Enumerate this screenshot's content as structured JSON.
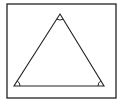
{
  "figure": {
    "stroke_color": "#222222",
    "background_color": "#ffffff",
    "frame": {
      "x": 7,
      "y": 4,
      "width": 109,
      "height": 94,
      "stroke_width": 1.3
    },
    "triangle": {
      "vertices": {
        "apex": [
          60,
          14
        ],
        "bottom_left": [
          14,
          86
        ],
        "bottom_right": [
          104,
          86
        ]
      },
      "stroke_width": 1.1
    },
    "angle_marks": [
      {
        "vertex": "apex",
        "radius": 6
      },
      {
        "vertex": "bottom_left",
        "radius": 6
      },
      {
        "vertex": "bottom_right",
        "radius": 6
      }
    ]
  }
}
